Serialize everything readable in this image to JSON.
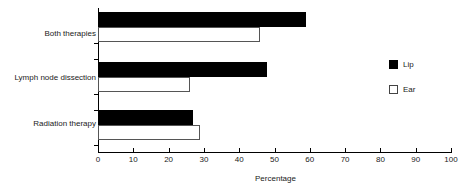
{
  "chart_data": {
    "type": "bar",
    "orientation": "horizontal",
    "title": "",
    "xlabel": "Percentage",
    "ylabel": "",
    "xlim": [
      0,
      100
    ],
    "xticks": [
      0,
      10,
      20,
      30,
      40,
      50,
      60,
      70,
      80,
      90,
      100
    ],
    "xtick_labels": [
      "0",
      "10",
      "20",
      "30",
      "40",
      "50",
      "60",
      "70",
      "80",
      "90",
      "100"
    ],
    "grid": false,
    "legend_position": "right",
    "categories": [
      "Both therapies",
      "Lymph node dissection",
      "Radiation therapy"
    ],
    "series": [
      {
        "name": "Lip",
        "color": "#000000",
        "fill": "solid",
        "values": [
          59,
          48,
          27
        ]
      },
      {
        "name": "Ear",
        "color": "#ffffff",
        "fill": "open",
        "values": [
          46,
          26,
          29
        ]
      }
    ]
  },
  "legend": {
    "items": [
      {
        "label": "Lip",
        "swatch": "filled-square-icon"
      },
      {
        "label": "Ear",
        "swatch": "open-square-icon"
      }
    ]
  }
}
